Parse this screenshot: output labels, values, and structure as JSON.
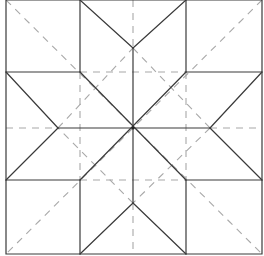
{
  "diagram": {
    "colors": {
      "solid": "#3a3a3a",
      "dashed": "#a8a8a8",
      "background": "#ffffff"
    },
    "outer_square": [
      [
        6,
        0
      ],
      [
        262,
        0
      ],
      [
        262,
        254
      ],
      [
        6,
        254
      ]
    ],
    "solid_lines": [
      [
        80,
        0,
        80,
        72
      ],
      [
        186,
        0,
        186,
        72
      ],
      [
        80,
        180,
        80,
        254
      ],
      [
        186,
        180,
        186,
        254
      ],
      [
        6,
        72,
        80,
        72
      ],
      [
        186,
        72,
        262,
        72
      ],
      [
        6,
        180,
        80,
        180
      ],
      [
        186,
        180,
        262,
        180
      ],
      [
        133,
        48,
        133,
        203
      ],
      [
        58,
        128,
        210,
        128
      ],
      [
        80,
        72,
        186,
        180
      ],
      [
        186,
        72,
        80,
        180
      ],
      [
        80,
        0,
        133,
        48
      ],
      [
        186,
        0,
        133,
        48
      ],
      [
        6,
        72,
        58,
        128
      ],
      [
        6,
        180,
        58,
        128
      ],
      [
        262,
        72,
        210,
        128
      ],
      [
        262,
        180,
        210,
        128
      ],
      [
        80,
        254,
        133,
        203
      ],
      [
        186,
        254,
        133,
        203
      ]
    ],
    "dashed_lines": [
      [
        6,
        0,
        262,
        254
      ],
      [
        262,
        0,
        6,
        254
      ],
      [
        58,
        128,
        133,
        48
      ],
      [
        133,
        48,
        210,
        128
      ],
      [
        210,
        128,
        133,
        203
      ],
      [
        133,
        203,
        58,
        128
      ],
      [
        80,
        72,
        186,
        72
      ],
      [
        80,
        180,
        186,
        180
      ],
      [
        80,
        72,
        80,
        180
      ],
      [
        186,
        72,
        186,
        180
      ],
      [
        6,
        128,
        58,
        128
      ],
      [
        210,
        128,
        262,
        128
      ],
      [
        133,
        0,
        133,
        48
      ],
      [
        133,
        203,
        133,
        254
      ]
    ],
    "center": [
      133,
      128
    ]
  }
}
